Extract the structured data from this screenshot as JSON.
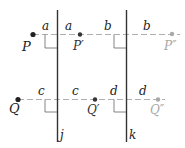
{
  "diagram": {
    "type": "reflection-across-parallel-lines",
    "colors": {
      "line": "#333333",
      "dash": "#9a9a9a",
      "point_dark": "#222222",
      "point_light": "#a8a8a8",
      "label_dark": "#222222",
      "label_light": "#a8a8a8"
    },
    "lines": [
      {
        "name": "j",
        "label": "j",
        "x": 57
      },
      {
        "name": "k",
        "label": "k",
        "x": 126
      }
    ],
    "rows": [
      {
        "y": 34,
        "points": [
          {
            "label": "P",
            "x": 33,
            "shade": "dark"
          },
          {
            "label": "P′",
            "x": 80,
            "shade": "dark"
          },
          {
            "label": "P″",
            "x": 172,
            "shade": "light"
          }
        ],
        "distances": [
          {
            "label": "a",
            "x": 45
          },
          {
            "label": "a",
            "x": 68
          },
          {
            "label": "b",
            "x": 107
          },
          {
            "label": "b",
            "x": 146
          }
        ]
      },
      {
        "y": 99,
        "points": [
          {
            "label": "Q",
            "x": 18,
            "shade": "dark"
          },
          {
            "label": "Q′",
            "x": 95,
            "shade": "dark"
          },
          {
            "label": "Q″",
            "x": 158,
            "shade": "light"
          }
        ],
        "distances": [
          {
            "label": "c",
            "x": 41
          },
          {
            "label": "c",
            "x": 75
          },
          {
            "label": "d",
            "x": 113
          },
          {
            "label": "d",
            "x": 142
          }
        ]
      }
    ]
  }
}
